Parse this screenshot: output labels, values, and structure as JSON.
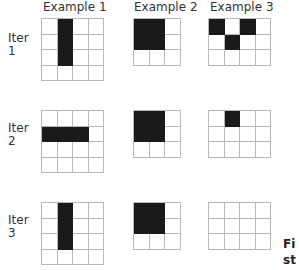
{
  "columns": [
    {
      "title": "Example 1"
    },
    {
      "title": "Example 2"
    },
    {
      "title": "Example 3"
    }
  ],
  "rows": [
    {
      "label_line1": "Iter",
      "label_line2": "1"
    },
    {
      "label_line1": "Iter",
      "label_line2": "2"
    },
    {
      "label_line1": "Iter",
      "label_line2": "3"
    }
  ],
  "grids": {
    "iter1": {
      "example1": {
        "cols": 4,
        "rows": 4,
        "cells": [
          [
            0,
            1,
            0,
            0
          ],
          [
            0,
            1,
            0,
            0
          ],
          [
            0,
            1,
            0,
            0
          ],
          [
            0,
            0,
            0,
            0
          ]
        ]
      },
      "example2": {
        "cols": 3,
        "rows": 3,
        "cells": [
          [
            1,
            1,
            0
          ],
          [
            1,
            1,
            0
          ],
          [
            0,
            0,
            0
          ]
        ]
      },
      "example3": {
        "cols": 4,
        "rows": 3,
        "cells": [
          [
            1,
            0,
            1,
            0
          ],
          [
            0,
            1,
            0,
            0
          ],
          [
            0,
            0,
            0,
            0
          ]
        ]
      }
    },
    "iter2": {
      "example1": {
        "cols": 4,
        "rows": 4,
        "cells": [
          [
            0,
            0,
            0,
            0
          ],
          [
            1,
            1,
            1,
            0
          ],
          [
            0,
            0,
            0,
            0
          ],
          [
            0,
            0,
            0,
            0
          ]
        ]
      },
      "example2": {
        "cols": 3,
        "rows": 3,
        "cells": [
          [
            1,
            1,
            0
          ],
          [
            1,
            1,
            0
          ],
          [
            0,
            0,
            0
          ]
        ]
      },
      "example3": {
        "cols": 4,
        "rows": 3,
        "cells": [
          [
            0,
            1,
            0,
            0
          ],
          [
            0,
            0,
            0,
            0
          ],
          [
            0,
            0,
            0,
            0
          ]
        ]
      }
    },
    "iter3": {
      "example1": {
        "cols": 4,
        "rows": 4,
        "cells": [
          [
            0,
            1,
            0,
            0
          ],
          [
            0,
            1,
            0,
            0
          ],
          [
            0,
            1,
            0,
            0
          ],
          [
            0,
            0,
            0,
            0
          ]
        ]
      },
      "example2": {
        "cols": 3,
        "rows": 3,
        "cells": [
          [
            1,
            1,
            0
          ],
          [
            1,
            1,
            0
          ],
          [
            0,
            0,
            0
          ]
        ]
      },
      "example3": {
        "cols": 4,
        "rows": 3,
        "cells": [
          [
            0,
            0,
            0,
            0
          ],
          [
            0,
            0,
            0,
            0
          ],
          [
            0,
            0,
            0,
            0
          ]
        ]
      }
    }
  },
  "caption": {
    "line1": "Fi",
    "line2": "st"
  },
  "colors": {
    "filled": "#1a1a1a",
    "empty": "#ffffff",
    "gridline": "#b8b8b8"
  }
}
